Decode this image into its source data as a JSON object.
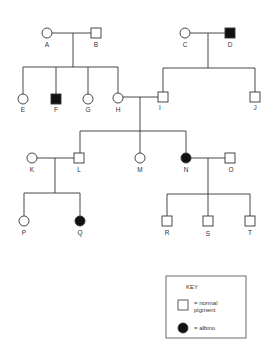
{
  "diagram": {
    "type": "pedigree",
    "trait": "albinism",
    "individuals": [
      {
        "id": "A",
        "sex": "female",
        "affected": false,
        "generation": 1
      },
      {
        "id": "B",
        "sex": "male",
        "affected": false,
        "generation": 1
      },
      {
        "id": "C",
        "sex": "female",
        "affected": false,
        "generation": 1
      },
      {
        "id": "D",
        "sex": "male",
        "affected": true,
        "generation": 1
      },
      {
        "id": "E",
        "sex": "female",
        "affected": false,
        "generation": 2
      },
      {
        "id": "F",
        "sex": "male",
        "affected": true,
        "generation": 2
      },
      {
        "id": "G",
        "sex": "female",
        "affected": false,
        "generation": 2
      },
      {
        "id": "H",
        "sex": "female",
        "affected": false,
        "generation": 2
      },
      {
        "id": "I",
        "sex": "male",
        "affected": false,
        "generation": 2
      },
      {
        "id": "J",
        "sex": "male",
        "affected": false,
        "generation": 2
      },
      {
        "id": "K",
        "sex": "female",
        "affected": false,
        "generation": 3
      },
      {
        "id": "L",
        "sex": "male",
        "affected": false,
        "generation": 3
      },
      {
        "id": "M",
        "sex": "female",
        "affected": false,
        "generation": 3
      },
      {
        "id": "N",
        "sex": "female",
        "affected": true,
        "generation": 3
      },
      {
        "id": "O",
        "sex": "male",
        "affected": false,
        "generation": 3
      },
      {
        "id": "P",
        "sex": "female",
        "affected": false,
        "generation": 4
      },
      {
        "id": "Q",
        "sex": "female",
        "affected": true,
        "generation": 4
      },
      {
        "id": "R",
        "sex": "male",
        "affected": false,
        "generation": 4
      },
      {
        "id": "S",
        "sex": "male",
        "affected": false,
        "generation": 4
      },
      {
        "id": "T",
        "sex": "male",
        "affected": false,
        "generation": 4
      }
    ],
    "couples": [
      [
        "A",
        "B"
      ],
      [
        "C",
        "D"
      ],
      [
        "H",
        "I"
      ],
      [
        "K",
        "L"
      ],
      [
        "N",
        "O"
      ]
    ],
    "children": {
      "A+B": [
        "E",
        "F",
        "G",
        "H"
      ],
      "C+D": [
        "I",
        "J"
      ],
      "H+I": [
        "L",
        "M",
        "N"
      ],
      "K+L": [
        "P",
        "Q"
      ],
      "N+O": [
        "R",
        "S",
        "T"
      ]
    }
  },
  "labels": {
    "A": "A",
    "B": "B",
    "C": "C",
    "D": "D",
    "E": "E",
    "F": "F",
    "G": "G",
    "H": "H",
    "I": "I",
    "J": "J",
    "K": "K",
    "L": "L",
    "M": "M",
    "N": "N",
    "O": "O",
    "P": "P",
    "Q": "Q",
    "R": "R",
    "S": "S",
    "T": "T"
  },
  "key": {
    "title": "KEY",
    "normal_line1": "= normal",
    "normal_line2": "pigment",
    "albino": "= albino"
  },
  "colors": {
    "line": "#333333",
    "affected": "#111111",
    "background": "#ffffff"
  }
}
